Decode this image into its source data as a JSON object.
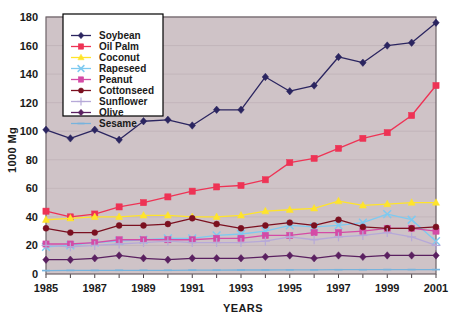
{
  "chart_data": {
    "type": "line",
    "title": "",
    "xlabel": "YEARS",
    "ylabel": "1000  Mg",
    "x": [
      1985,
      1986,
      1987,
      1988,
      1989,
      1990,
      1991,
      1992,
      1993,
      1994,
      1995,
      1996,
      1997,
      1998,
      1999,
      2000,
      2001
    ],
    "xticklabels": [
      "1985",
      "",
      "1987",
      "",
      "1989",
      "",
      "1991",
      "",
      "1993",
      "",
      "1995",
      "",
      "1997",
      "",
      "1999",
      "",
      "2001"
    ],
    "xlim": [
      1985,
      2001
    ],
    "ylim": [
      0,
      180
    ],
    "yticks": [
      0,
      20,
      40,
      60,
      80,
      100,
      120,
      140,
      160,
      180
    ],
    "yticklabels": [
      "0",
      "20",
      "40",
      "60",
      "80",
      "100",
      "120",
      "140",
      "160",
      "180"
    ],
    "grid": "horizontal",
    "legend_position": "upper-left-inside",
    "plot_background": "#cfc3c7",
    "series": [
      {
        "name": "Soybean",
        "color": "#2b2560",
        "marker": "diamond",
        "values": [
          101,
          95,
          101,
          94,
          107,
          108,
          104,
          115,
          115,
          138,
          128,
          132,
          152,
          148,
          160,
          162,
          176
        ]
      },
      {
        "name": "Oil Palm",
        "color": "#ee3355",
        "marker": "square",
        "values": [
          44,
          40,
          42,
          47,
          50,
          54,
          58,
          61,
          62,
          66,
          78,
          81,
          88,
          95,
          99,
          111,
          132
        ]
      },
      {
        "name": "Coconut",
        "color": "#ffe42a",
        "marker": "triangle",
        "values": [
          38,
          39,
          40,
          40,
          41,
          41,
          40,
          40,
          41,
          44,
          45,
          46,
          51,
          48,
          49,
          50,
          50
        ]
      },
      {
        "name": "Rapeseed",
        "color": "#7ecaf0",
        "marker": "cross",
        "values": [
          19,
          20,
          22,
          23,
          24,
          25,
          25,
          27,
          28,
          30,
          34,
          33,
          34,
          36,
          42,
          38,
          23
        ]
      },
      {
        "name": "Peanut",
        "color": "#d44ba6",
        "marker": "square",
        "values": [
          21,
          21,
          22,
          24,
          24,
          24,
          24,
          25,
          25,
          27,
          27,
          29,
          29,
          30,
          32,
          32,
          30
        ]
      },
      {
        "name": "Cottonseed",
        "color": "#7b1020",
        "marker": "circle",
        "values": [
          32,
          29,
          29,
          34,
          34,
          35,
          39,
          35,
          32,
          34,
          36,
          34,
          38,
          33,
          32,
          32,
          33
        ]
      },
      {
        "name": "Sunflower",
        "color": "#b6a9d8",
        "marker": "plus",
        "values": [
          20,
          19,
          20,
          21,
          22,
          23,
          22,
          22,
          22,
          23,
          26,
          24,
          26,
          27,
          29,
          26,
          20
        ]
      },
      {
        "name": "Olive",
        "color": "#5a2060",
        "marker": "diamond",
        "values": [
          10,
          10,
          11,
          13,
          11,
          10,
          11,
          11,
          11,
          12,
          13,
          11,
          13,
          12,
          13,
          13,
          13
        ]
      },
      {
        "name": "Sesame",
        "color": "#77b3dd",
        "marker": "dash",
        "values": [
          2.4,
          2.5,
          2.5,
          2.6,
          2.6,
          2.6,
          2.7,
          2.7,
          2.8,
          2.8,
          2.9,
          2.9,
          3.0,
          3.0,
          3.1,
          3.1,
          3.1
        ]
      }
    ]
  }
}
